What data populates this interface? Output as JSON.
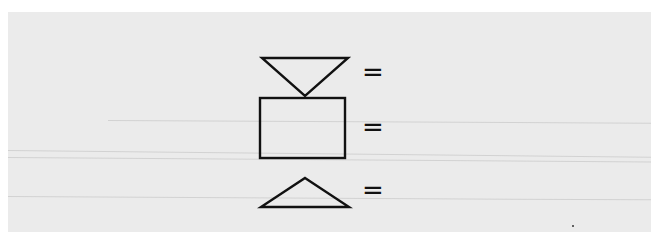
{
  "figure": {
    "rows": [
      {
        "shape": "inverted-triangle",
        "symbol": "="
      },
      {
        "shape": "rectangle",
        "symbol": "="
      },
      {
        "shape": "triangle",
        "symbol": "="
      }
    ],
    "colors": {
      "background": "#ebebeb",
      "border": "#ffffff",
      "stroke": "#111111"
    }
  }
}
